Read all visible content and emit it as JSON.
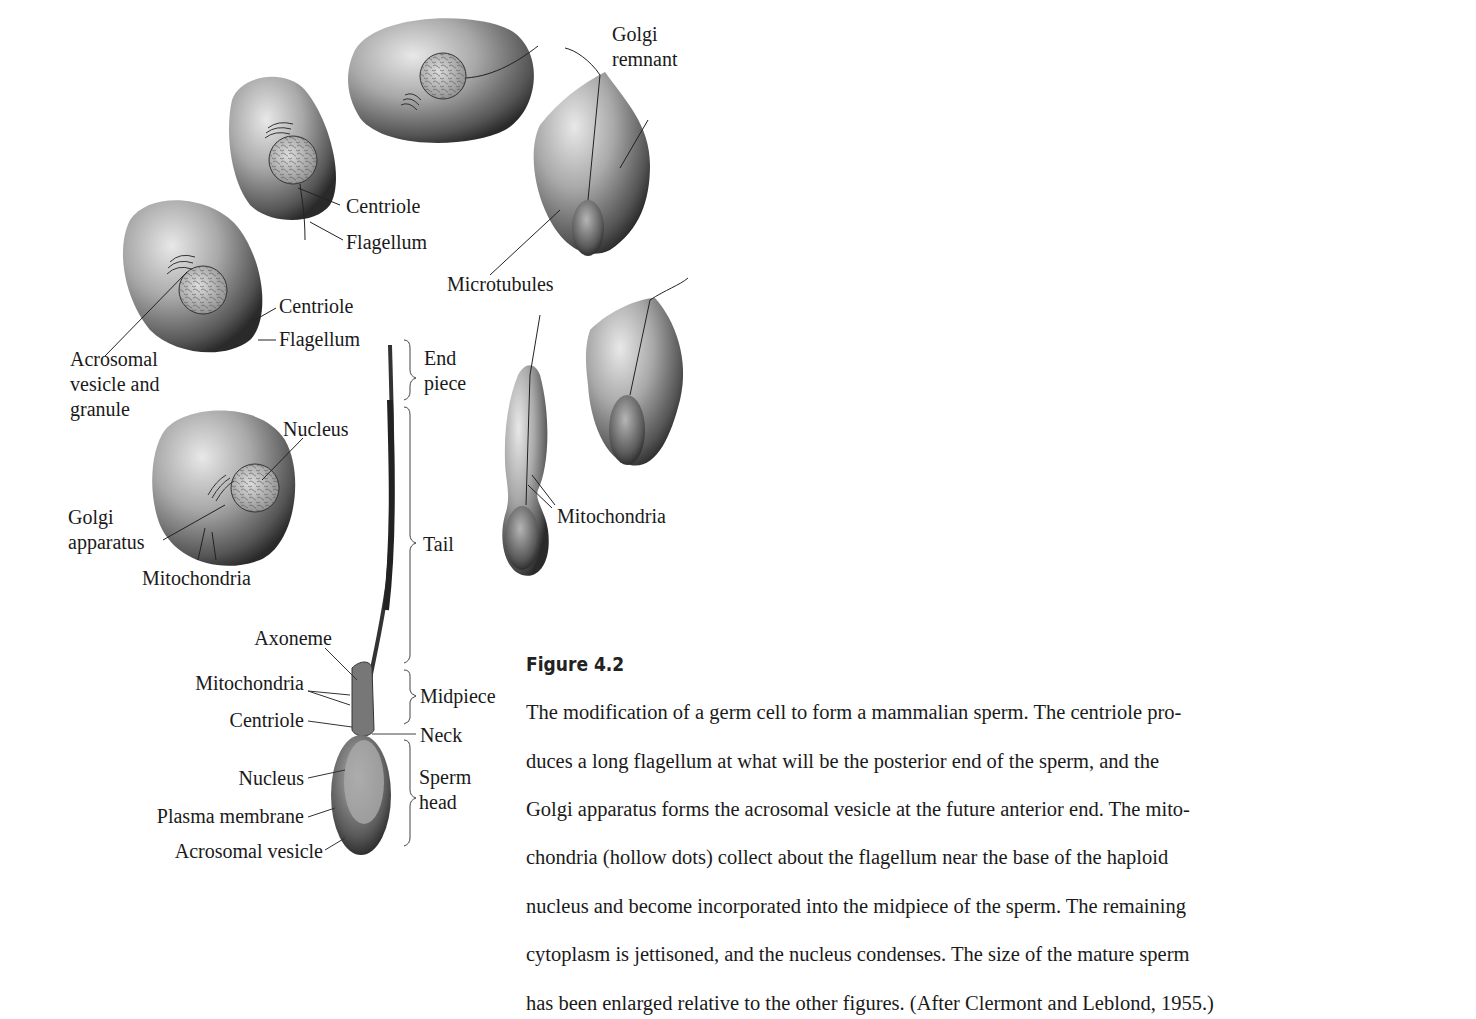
{
  "figure": {
    "number": "Figure 4.2",
    "caption_lines": [
      "The modification of a germ cell to form a mammalian sperm. The centriole pro-",
      "duces a long flagellum at what will be the posterior end of the sperm, and the",
      "Golgi apparatus forms the acrosomal vesicle at the future anterior end. The mito-",
      "chondria (hollow dots) collect about the flagellum near the base of the haploid",
      "nucleus and become incorporated into the midpiece of the sperm. The remaining",
      "cytoplasm is jettisoned, and the nucleus condenses. The size of the mature sperm",
      "has been enlarged relative to the other figures. (After Clermont and Leblond, 1955.)"
    ]
  },
  "labels": {
    "golgi_remnant": "Golgi\nremnant",
    "centriole_1": "Centriole",
    "flagellum_1": "Flagellum",
    "microtubules": "Microtubules",
    "centriole_2": "Centriole",
    "flagellum_2": "Flagellum",
    "acrosomal_vesicle_granule": "Acrosomal\nvesicle and\ngranule",
    "nucleus_cell": "Nucleus",
    "golgi_apparatus": "Golgi\napparatus",
    "mitochondria_cell": "Mitochondria",
    "mitochondria_spermatid": "Mitochondria",
    "end_piece": "End\npiece",
    "tail": "Tail",
    "midpiece": "Midpiece",
    "neck": "Neck",
    "sperm_head": "Sperm\nhead",
    "axoneme": "Axoneme",
    "mitochondria_sperm": "Mitochondria",
    "centriole_sperm": "Centriole",
    "nucleus_sperm": "Nucleus",
    "plasma_membrane": "Plasma membrane",
    "acrosomal_vesicle": "Acrosomal vesicle"
  }
}
